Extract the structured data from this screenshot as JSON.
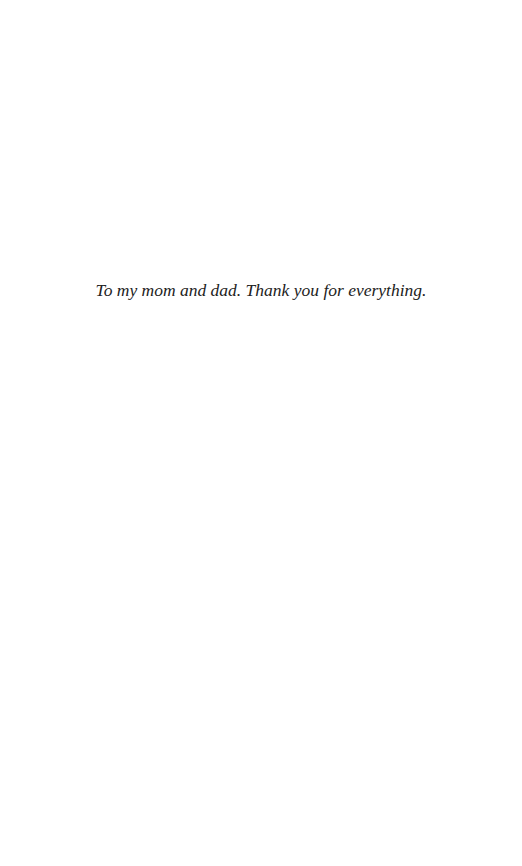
{
  "page": {
    "dedication": "To my mom and dad. Thank you for everything."
  }
}
